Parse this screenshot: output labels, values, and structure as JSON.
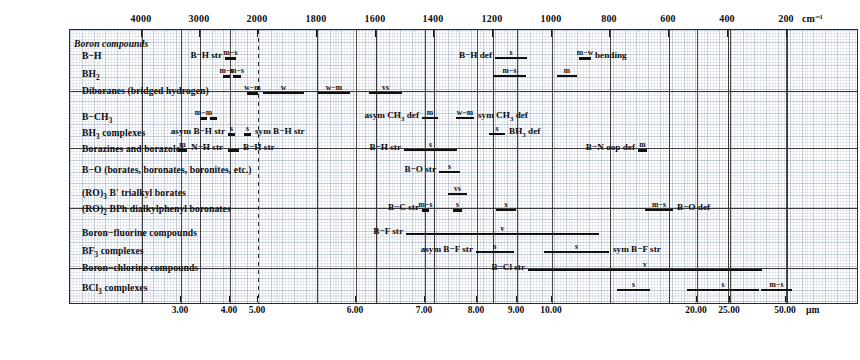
{
  "chart_data": {
    "type": "table",
    "xlabel_top": "cm⁻¹",
    "xlabel_bottom": "µm",
    "x_axis_top": {
      "unit": "cm-1",
      "ticks": [
        4000,
        3000,
        2000,
        1800,
        1600,
        1400,
        1200,
        1000,
        800,
        600,
        400,
        200
      ],
      "tick_px": [
        141,
        199,
        257,
        316,
        375,
        433,
        492,
        551,
        609,
        668,
        727,
        786
      ]
    },
    "x_axis_bottom": {
      "unit": "um",
      "ticks": [
        "3.00",
        "4.00",
        "5.00",
        "6.00",
        "7.00",
        "8.00",
        "9.00",
        "10.00",
        "20.00",
        "25.00",
        "50.00"
      ],
      "tick_px": [
        180,
        229,
        257,
        355,
        424,
        476,
        516,
        551,
        696,
        729,
        785
      ]
    },
    "rows": [
      {
        "label": "Boron compounds",
        "italic": true
      },
      {
        "label": "B−H"
      },
      {
        "label": "BH₂"
      },
      {
        "label": "Diboranes (bridged hydrogen)"
      },
      {
        "label": "B−CH₃"
      },
      {
        "label": "BH₃ complexes"
      },
      {
        "label": "Borazines and borazoles"
      },
      {
        "label": "B−O (borates, boronates, boronites, etc.)"
      },
      {
        "label": "(RO)₃ B′ trialkyl borates"
      },
      {
        "label": "(RO)₂ BPh dialkylphenyl boronates"
      },
      {
        "label": "Boron−fluorine compounds"
      },
      {
        "label": "BF₃ complexes"
      },
      {
        "label": "Boron−chlorine compounds"
      },
      {
        "label": "BCl₃ complexes"
      }
    ],
    "bands": [
      {
        "row": "B-H",
        "label": "B−H str",
        "label_side": "left",
        "intensity": "m−s",
        "x1": 224,
        "x2": 235
      },
      {
        "row": "B-H",
        "label": "B−H def",
        "label_side": "left",
        "intensity": "s",
        "x1": 494,
        "x2": 526
      },
      {
        "row": "B-H",
        "label": "bending",
        "label_side": "right",
        "intensity": "m−w",
        "x1": 578,
        "x2": 590
      },
      {
        "row": "BH2",
        "label": "",
        "label_side": "none",
        "intensity": "m−s",
        "x1": 222,
        "x2": 229
      },
      {
        "row": "BH2",
        "label": "",
        "label_side": "none",
        "intensity": "m−s",
        "x1": 232,
        "x2": 240
      },
      {
        "row": "BH2",
        "label": "",
        "label_side": "none",
        "intensity": "m−s",
        "x1": 492,
        "x2": 525
      },
      {
        "row": "BH2",
        "label": "",
        "label_side": "none",
        "intensity": "m",
        "x1": 556,
        "x2": 576
      },
      {
        "row": "Diboranes",
        "label": "",
        "label_side": "none",
        "intensity": "w−m",
        "x1": 246,
        "x2": 257
      },
      {
        "row": "Diboranes",
        "label": "",
        "label_side": "none",
        "intensity": "w",
        "x1": 262,
        "x2": 303
      },
      {
        "row": "Diboranes",
        "label": "",
        "label_side": "none",
        "intensity": "w−m",
        "x1": 317,
        "x2": 349
      },
      {
        "row": "Diboranes",
        "label": "",
        "label_side": "none",
        "intensity": "vs",
        "x1": 368,
        "x2": 401
      },
      {
        "row": "B-CH3",
        "label": "",
        "label_side": "none",
        "intensity": "m−m",
        "x1": 199,
        "x2": 206
      },
      {
        "row": "B-CH3",
        "label": "",
        "label_side": "none",
        "intensity": "",
        "x1": 209,
        "x2": 216
      },
      {
        "row": "B-CH3",
        "label": "asym CH₃ def",
        "label_side": "left",
        "intensity": "m",
        "x1": 421,
        "x2": 437
      },
      {
        "row": "B-CH3",
        "label": "sym CH₃ def",
        "label_side": "right",
        "intensity": "w−m",
        "x1": 455,
        "x2": 473
      },
      {
        "row": "BH3 complexes",
        "label": "asym B−H str",
        "label_side": "left",
        "intensity": "s",
        "x1": 227,
        "x2": 234
      },
      {
        "row": "BH3 complexes",
        "label": "sym B−H str",
        "label_side": "right",
        "intensity": "s",
        "x1": 243,
        "x2": 250
      },
      {
        "row": "BH3 complexes",
        "label": "BH₃ def",
        "label_side": "right",
        "intensity": "s",
        "x1": 488,
        "x2": 504
      },
      {
        "row": "Borazines",
        "label": "N−H str",
        "label_side": "right",
        "intensity": "m",
        "x1": 177,
        "x2": 186
      },
      {
        "row": "Borazines",
        "label": "B−H str",
        "label_side": "right",
        "intensity": "",
        "x1": 227,
        "x2": 238
      },
      {
        "row": "Borazines",
        "label": "B−H str",
        "label_side": "left",
        "intensity": "s",
        "x1": 403,
        "x2": 456
      },
      {
        "row": "Borazines",
        "label": "B−N  oop def",
        "label_side": "left",
        "intensity": "m",
        "x1": 637,
        "x2": 646
      },
      {
        "row": "B-O",
        "label": "B−O str",
        "label_side": "left",
        "intensity": "s",
        "x1": 438,
        "x2": 459
      },
      {
        "row": "RO3B",
        "label": "",
        "label_side": "none",
        "intensity": "vs",
        "x1": 447,
        "x2": 466
      },
      {
        "row": "RO2BPh",
        "label": "B−C str",
        "label_side": "left",
        "intensity": "m−s",
        "x1": 421,
        "x2": 428
      },
      {
        "row": "RO2BPh",
        "label": "",
        "label_side": "none",
        "intensity": "s",
        "x1": 452,
        "x2": 461
      },
      {
        "row": "RO2BPh",
        "label": "",
        "label_side": "none",
        "intensity": "s",
        "x1": 495,
        "x2": 515
      },
      {
        "row": "RO2BPh",
        "label": "B−O def",
        "label_side": "right",
        "intensity": "m−s",
        "x1": 644,
        "x2": 672
      },
      {
        "row": "B-F",
        "label": "B−F str",
        "label_side": "left",
        "intensity": "v",
        "x1": 405,
        "x2": 598
      },
      {
        "row": "BF3 complexes",
        "label": "asym B−F str",
        "label_side": "left",
        "intensity": "s",
        "x1": 475,
        "x2": 513
      },
      {
        "row": "BF3 complexes",
        "label": "sym B−F str",
        "label_side": "right",
        "intensity": "s",
        "x1": 543,
        "x2": 608
      },
      {
        "row": "B-Cl",
        "label": "B−Cl str",
        "label_side": "left",
        "intensity": "v",
        "x1": 527,
        "x2": 761
      },
      {
        "row": "BCl3",
        "label": "",
        "label_side": "none",
        "intensity": "s",
        "x1": 616,
        "x2": 649
      },
      {
        "row": "BCl3",
        "label": "",
        "label_side": "none",
        "intensity": "s",
        "x1": 686,
        "x2": 758
      },
      {
        "row": "BCl3",
        "label": "",
        "label_side": "none",
        "intensity": "m−s",
        "x1": 760,
        "x2": 791
      }
    ]
  },
  "axis": {
    "unit_top": "cm⁻¹",
    "unit_bottom": "µm"
  }
}
